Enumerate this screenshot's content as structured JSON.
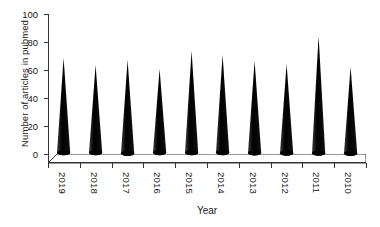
{
  "chart_data": {
    "type": "bar",
    "title": "",
    "xlabel": "Year",
    "ylabel": "Number of articles in pubmed",
    "categories": [
      "2019",
      "2018",
      "2017",
      "2016",
      "2015",
      "2014",
      "2013",
      "2012",
      "2011",
      "2010"
    ],
    "values": [
      67,
      62,
      66,
      59,
      72,
      69,
      65,
      63,
      83,
      61
    ],
    "ylim": [
      0,
      100
    ],
    "yticks": [
      0,
      20,
      40,
      60,
      80,
      100
    ],
    "ytick_labels": [
      "0",
      "20",
      "40",
      "60",
      "80",
      "100"
    ],
    "grid": false,
    "legend": false,
    "legend_position": "none",
    "style": "3d-cone",
    "series_color": "#000000",
    "axis_color": "#333333",
    "baseplate_fill": "#ffffff",
    "xtick_rotation": 90
  }
}
